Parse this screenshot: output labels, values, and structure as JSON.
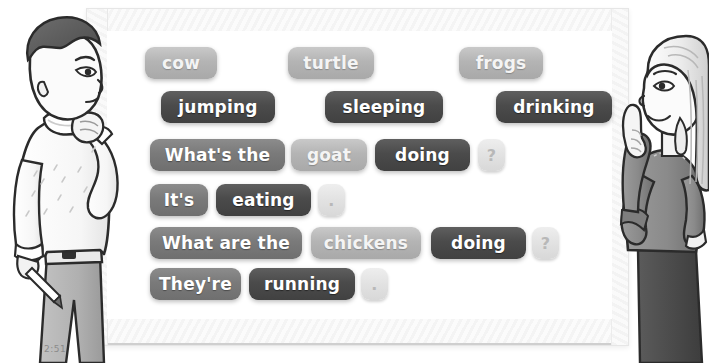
{
  "scene": {
    "timestamp": "2:51",
    "board_label": "whiteboard"
  },
  "whiteboard": {
    "rows": [
      {
        "row_name": "nouns-row",
        "tiles": [
          {
            "text": "cow",
            "style": "light",
            "x": 145,
            "y": 47,
            "w": 72
          },
          {
            "text": "turtle",
            "style": "light",
            "x": 288,
            "y": 47,
            "w": 86
          },
          {
            "text": "frogs",
            "style": "light",
            "x": 459,
            "y": 47,
            "w": 84
          }
        ]
      },
      {
        "row_name": "verbs-row",
        "tiles": [
          {
            "text": "jumping",
            "style": "dark",
            "x": 161,
            "y": 91,
            "w": 114
          },
          {
            "text": "sleeping",
            "style": "dark",
            "x": 325,
            "y": 91,
            "w": 118
          },
          {
            "text": "drinking",
            "style": "dark",
            "x": 496,
            "y": 91,
            "w": 116
          }
        ]
      },
      {
        "row_name": "question-singular-row",
        "tiles": [
          {
            "text": "What's the",
            "style": "medium",
            "x": 150,
            "y": 139,
            "w": 135
          },
          {
            "text": "goat",
            "style": "light",
            "x": 291,
            "y": 139,
            "w": 76
          },
          {
            "text": "doing",
            "style": "dark",
            "x": 375,
            "y": 139,
            "w": 95
          },
          {
            "text": "?",
            "style": "punct",
            "x": 478,
            "y": 139,
            "w": 27
          }
        ]
      },
      {
        "row_name": "answer-singular-row",
        "tiles": [
          {
            "text": "It's",
            "style": "medium",
            "x": 150,
            "y": 184,
            "w": 58
          },
          {
            "text": "eating",
            "style": "dark",
            "x": 216,
            "y": 184,
            "w": 95
          },
          {
            "text": ".",
            "style": "punct",
            "x": 318,
            "y": 184,
            "w": 27
          }
        ]
      },
      {
        "row_name": "question-plural-row",
        "tiles": [
          {
            "text": "What are the",
            "style": "medium",
            "x": 150,
            "y": 227,
            "w": 152
          },
          {
            "text": "chickens",
            "style": "light",
            "x": 311,
            "y": 227,
            "w": 110
          },
          {
            "text": "doing",
            "style": "dark",
            "x": 431,
            "y": 227,
            "w": 95
          },
          {
            "text": "?",
            "style": "punct",
            "x": 532,
            "y": 227,
            "w": 27
          }
        ]
      },
      {
        "row_name": "answer-plural-row",
        "tiles": [
          {
            "text": "They're",
            "style": "medium",
            "x": 150,
            "y": 268,
            "w": 91
          },
          {
            "text": "running",
            "style": "dark",
            "x": 249,
            "y": 268,
            "w": 106
          },
          {
            "text": ".",
            "style": "punct",
            "x": 361,
            "y": 268,
            "w": 27
          }
        ]
      }
    ]
  },
  "characters": {
    "boy": {
      "name": "thinking-boy-illustration",
      "pose": "hand-on-chin"
    },
    "girl": {
      "name": "pointing-girl-illustration",
      "pose": "index-finger-up"
    }
  },
  "colors": {
    "tile_light": "#b4b4b4",
    "tile_medium": "#7a7a7a",
    "tile_dark": "#4b4b4b",
    "tile_punct": "#e2e2e2",
    "board": "#ffffff",
    "frame": "#f4f4f4"
  }
}
